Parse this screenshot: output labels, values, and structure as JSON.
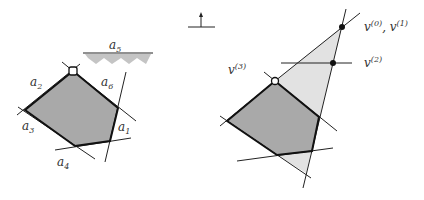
{
  "colors": {
    "polygon_fill": "#a9a9a9",
    "light_fill": "#e2e2e2",
    "line": "#222222",
    "halfspace_hatch": "#c4c4c4"
  },
  "left_diagram": {
    "labels": {
      "a1": {
        "base": "a",
        "sub": "1"
      },
      "a2": {
        "base": "a",
        "sub": "2"
      },
      "a3": {
        "base": "a",
        "sub": "3"
      },
      "a4": {
        "base": "a",
        "sub": "4"
      },
      "a5": {
        "base": "a",
        "sub": "5"
      },
      "a6": {
        "base": "a",
        "sub": "6"
      }
    },
    "polygon_vertices": [
      [
        73,
        71
      ],
      [
        118,
        108
      ],
      [
        110,
        141
      ],
      [
        75,
        146
      ],
      [
        25,
        110
      ]
    ],
    "open_vertex": [
      73,
      71
    ]
  },
  "right_diagram": {
    "objective_symbol": "up-arrow",
    "labels": {
      "v0v1": {
        "base1": "v",
        "sup1": "(0)",
        "sep": ", ",
        "base2": "v",
        "sup2": "(1)"
      },
      "v2": {
        "base": "v",
        "sup": "(2)"
      },
      "v3": {
        "base": "v",
        "sup": "(3)"
      }
    },
    "points": {
      "v0": [
        342,
        27
      ],
      "v2": [
        333,
        63
      ],
      "v3": [
        275,
        81
      ]
    }
  }
}
